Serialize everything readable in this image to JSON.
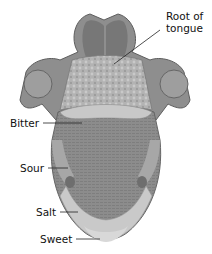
{
  "diagram": {
    "labels": [
      {
        "id": "root",
        "line1": "Root of",
        "line2": "tongue"
      },
      {
        "id": "bitter",
        "text": "Bitter"
      },
      {
        "id": "sour",
        "text": "Sour"
      },
      {
        "id": "salt",
        "text": "Salt"
      },
      {
        "id": "sweet",
        "text": "Sweet"
      }
    ],
    "colors": {
      "tongue_body": "#8a8a8a",
      "root_area": "#b5b5b5",
      "bitter_band": "#c8c8c8",
      "side_region": "#b9b9b9",
      "tip_region": "#d2d2d2",
      "throat": "#6f6f6f"
    }
  }
}
